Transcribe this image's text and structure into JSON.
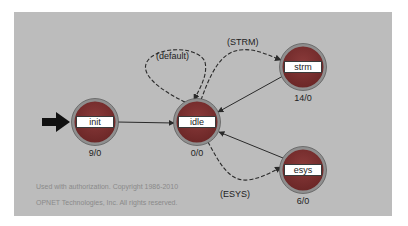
{
  "diagram": {
    "type": "state-machine",
    "colors": {
      "panel": "#bcbcbc",
      "node_fill": "#7a2f2f",
      "node_ring": "#8f8f8f",
      "edge": "#2a2a2a"
    },
    "states": [
      {
        "id": "init",
        "label": "init",
        "count": "9/0",
        "initial": true
      },
      {
        "id": "idle",
        "label": "idle",
        "count": "0/0"
      },
      {
        "id": "strm",
        "label": "strm",
        "count": "14/0"
      },
      {
        "id": "esys",
        "label": "esys",
        "count": "6/0"
      }
    ],
    "transitions": [
      {
        "from": "init",
        "to": "idle",
        "label": "",
        "style": "solid"
      },
      {
        "from": "idle",
        "to": "idle",
        "label": "(default)",
        "style": "dashed"
      },
      {
        "from": "idle",
        "to": "strm",
        "label": "(STRM)",
        "style": "dashed"
      },
      {
        "from": "strm",
        "to": "idle",
        "label": "",
        "style": "solid"
      },
      {
        "from": "idle",
        "to": "esys",
        "label": "(ESYS)",
        "style": "dashed"
      },
      {
        "from": "esys",
        "to": "idle",
        "label": "",
        "style": "solid"
      }
    ]
  },
  "copyright": {
    "line1": "Used with authorization. Copyright 1986-2010",
    "line2": "OPNET Technologies, Inc.  All rights reserved."
  }
}
